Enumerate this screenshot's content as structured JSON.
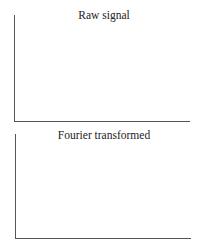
{
  "panels": [
    {
      "title": "Raw signal"
    },
    {
      "title": "Fourier transformed"
    }
  ]
}
